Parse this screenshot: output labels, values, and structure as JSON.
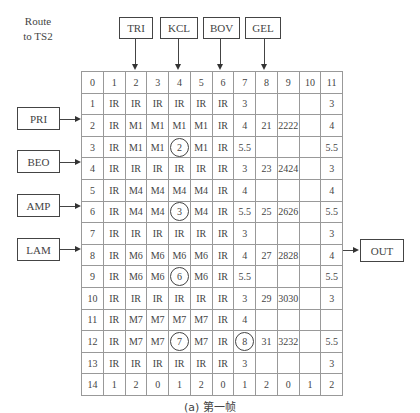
{
  "route_label": [
    "Route",
    "to TS2"
  ],
  "top_inputs": [
    {
      "label": "TRI",
      "column": 2
    },
    {
      "label": "KCL",
      "column": 4
    },
    {
      "label": "BOV",
      "column": 6
    },
    {
      "label": "GEL",
      "column": 8
    }
  ],
  "left_inputs": [
    {
      "label": "PRI",
      "row": 2
    },
    {
      "label": "BEO",
      "row": 4
    },
    {
      "label": "AMP",
      "row": 6
    },
    {
      "label": "LAM",
      "row": 8
    }
  ],
  "right_output": {
    "label": "OUT",
    "row": 8
  },
  "grid": {
    "rows": [
      [
        "0",
        "1",
        "2",
        "3",
        "4",
        "5",
        "6",
        "7",
        "8",
        "9",
        "10",
        "11"
      ],
      [
        "1",
        "IR",
        "IR",
        "IR",
        "IR",
        "IR",
        "IR",
        "3",
        "",
        "",
        "",
        "3"
      ],
      [
        "2",
        "IR",
        "M1",
        "M1",
        "M1",
        "M1",
        "IR",
        "4",
        "21",
        "2222",
        "",
        "4"
      ],
      [
        "3",
        "IR",
        "M1",
        "M1",
        "2",
        "M1",
        "IR",
        "5.5",
        "",
        "",
        "",
        "5.5"
      ],
      [
        "4",
        "IR",
        "IR",
        "IR",
        "IR",
        "IR",
        "IR",
        "3",
        "23",
        "2424",
        "",
        "3"
      ],
      [
        "5",
        "IR",
        "M4",
        "M4",
        "M4",
        "M4",
        "IR",
        "4",
        "",
        "",
        "",
        "4"
      ],
      [
        "6",
        "IR",
        "M4",
        "M4",
        "3",
        "M4",
        "IR",
        "5.5",
        "25",
        "2626",
        "",
        "5.5"
      ],
      [
        "7",
        "IR",
        "IR",
        "IR",
        "IR",
        "IR",
        "IR",
        "3",
        "",
        "",
        "",
        "3"
      ],
      [
        "8",
        "IR",
        "M6",
        "M6",
        "M6",
        "M6",
        "IR",
        "4",
        "27",
        "2828",
        "",
        "4"
      ],
      [
        "9",
        "IR",
        "M6",
        "M6",
        "6",
        "M6",
        "IR",
        "5.5",
        "",
        "",
        "",
        "5.5"
      ],
      [
        "10",
        "IR",
        "IR",
        "IR",
        "IR",
        "IR",
        "IR",
        "3",
        "29",
        "3030",
        "",
        "3"
      ],
      [
        "11",
        "IR",
        "M7",
        "M7",
        "M7",
        "M7",
        "IR",
        "4",
        "",
        "",
        "",
        ""
      ],
      [
        "12",
        "IR",
        "M7",
        "M7",
        "7",
        "M7",
        "IR",
        "8",
        "31",
        "3232",
        "",
        "5.5"
      ],
      [
        "13",
        "IR",
        "IR",
        "IR",
        "IR",
        "IR",
        "IR",
        "3",
        "",
        "",
        "",
        "3"
      ],
      [
        "14",
        "1",
        "2",
        "0",
        "1",
        "2",
        "0",
        "1",
        "2",
        "0",
        "1",
        "2"
      ]
    ],
    "circled_cells": [
      [
        3,
        4
      ],
      [
        6,
        4
      ],
      [
        9,
        4
      ],
      [
        12,
        4
      ],
      [
        12,
        7
      ]
    ]
  },
  "caption": "(a) 第一帧"
}
